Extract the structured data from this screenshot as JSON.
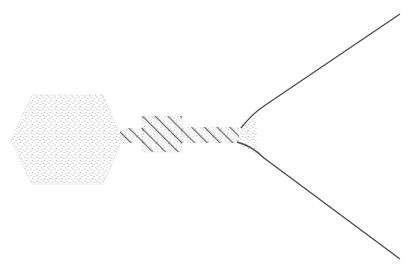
{
  "diagram": {
    "colors": {
      "background": "#ffffff",
      "stipple": "#8a8a8a",
      "hatch": "#6a6a6a",
      "line": "#4a4a4a"
    },
    "parts": [
      {
        "id": "head",
        "shape": "hexagon",
        "fill": "stipple"
      },
      {
        "id": "collar",
        "shape": "rectangle",
        "fill": "hatch"
      },
      {
        "id": "tail",
        "shape": "rectangle",
        "fill": "hatch"
      },
      {
        "id": "base-wedge",
        "shape": "triangle",
        "fill": "stipple"
      },
      {
        "id": "upper-fiber",
        "shape": "line"
      },
      {
        "id": "lower-fiber",
        "shape": "line"
      }
    ]
  }
}
